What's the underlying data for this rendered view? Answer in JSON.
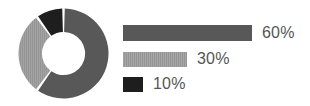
{
  "chart_data": {
    "type": "pie",
    "variant": "donut",
    "title": "",
    "subtitle": "",
    "xlabel": "",
    "ylabel": "",
    "grid": false,
    "legend_position": "right",
    "legend_style": "proportional-bars",
    "start_angle_deg": 0,
    "direction": "clockwise",
    "inner_radius_ratio": 0.48,
    "categories": [
      "60%",
      "30%",
      "10%"
    ],
    "values": [
      60,
      30,
      10
    ],
    "labels": [
      "60%",
      "30%",
      "10%"
    ],
    "colors": [
      "#585858",
      "#959595",
      "#1e1e1e"
    ],
    "slices": [
      {
        "label": "60%",
        "value": 60,
        "color": "#585858",
        "start_deg": 0,
        "end_deg": 216,
        "texture": "solid"
      },
      {
        "label": "30%",
        "value": 30,
        "color": "#959595",
        "start_deg": 216,
        "end_deg": 324,
        "texture": "vertical-stripes"
      },
      {
        "label": "10%",
        "value": 10,
        "color": "#1e1e1e",
        "start_deg": 324,
        "end_deg": 360,
        "texture": "solid"
      }
    ]
  },
  "donut": {
    "separator_color": "#ffffff",
    "hole_color": "#ffffff",
    "paths": [
      "M 46.5 1.5 A 45 45 0 0 1 20.05 82.9 L 33.07 65.01 A 23 23 0 0 0 46.5 23.5 Z",
      "M 18.38 81.57 A 45 45 0 0 1 18.66 13.18 L 32.39 30.43 A 23 23 0 0 0 32.25 65.39 Z",
      "M 20.27 11.87 A 45 45 0 0 1 44.5 1.52 L 44.5 23.52 A 23 23 0 0 0 33.12 28.4 Z"
    ]
  },
  "legend": {
    "rows": [
      {
        "label": "60%",
        "value": 60,
        "color": "#585858",
        "bar_px": 129,
        "texture": "solid"
      },
      {
        "label": "30%",
        "value": 30,
        "color": "#959595",
        "bar_px": 64,
        "texture": "vertical-stripes"
      },
      {
        "label": "10%",
        "value": 10,
        "color": "#1e1e1e",
        "bar_px": 20,
        "texture": "solid"
      }
    ]
  },
  "canvas": {
    "background": "#ffffff",
    "width": 310,
    "height": 106
  }
}
